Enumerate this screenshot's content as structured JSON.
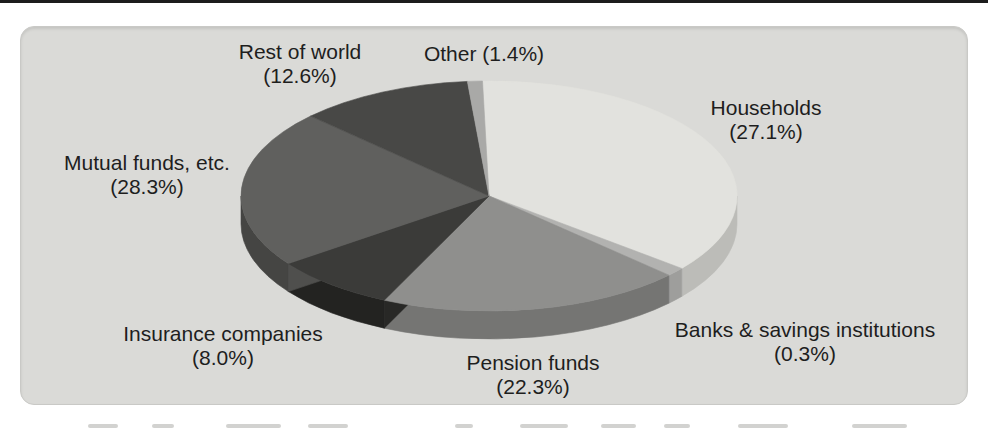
{
  "figure": {
    "background": "#ffffff",
    "panel_bg": "#dadad7",
    "text_color": "#1e1e1e"
  },
  "chart_data": {
    "type": "pie",
    "style": "3d-exploded-none",
    "unit": "%",
    "total": 100,
    "slices": [
      {
        "label": "Households",
        "value": 27.1,
        "pct_display": "(27.1%)",
        "top_color": "#e2e2de",
        "side_color": "#bcbcb8",
        "start_deg": 358.5,
        "end_deg": 129
      },
      {
        "label": "Banks & savings institutions",
        "value": 0.3,
        "pct_display": "(0.3%)",
        "top_color": "#b2b2b0",
        "side_color": "#9e9e9c",
        "start_deg": 129,
        "end_deg": 133.5
      },
      {
        "label": "Pension funds",
        "value": 22.3,
        "pct_display": "(22.3%)",
        "top_color": "#8f8f8d",
        "side_color": "#757573",
        "start_deg": 133.5,
        "end_deg": 205
      },
      {
        "label": "Insurance companies",
        "value": 8.0,
        "pct_display": "(8.0%)",
        "top_color": "#3b3b39",
        "side_color": "#232321",
        "wall_color": "#282826",
        "start_deg": 205,
        "end_deg": 234
      },
      {
        "label": "Mutual funds, etc.",
        "value": 28.3,
        "pct_display": "(28.3%)",
        "top_color": "#60605e",
        "side_color": "#454543",
        "wall_color": "#4f4f4d",
        "start_deg": 234,
        "end_deg": 314
      },
      {
        "label": "Rest of world",
        "value": 12.6,
        "pct_display": "(12.6%)",
        "top_color": "#484846",
        "start_deg": 314,
        "end_deg": 355
      },
      {
        "label": "Other",
        "value": 1.4,
        "pct_display": "(1.4%)",
        "top_color": "#a9a9a7",
        "start_deg": 355,
        "end_deg": 358.5
      }
    ],
    "geometry": {
      "cx": 489,
      "cy": 196,
      "rx": 248,
      "ry": 115,
      "depth": 28
    },
    "legend_position": "labels-around-pie",
    "grid": false
  }
}
